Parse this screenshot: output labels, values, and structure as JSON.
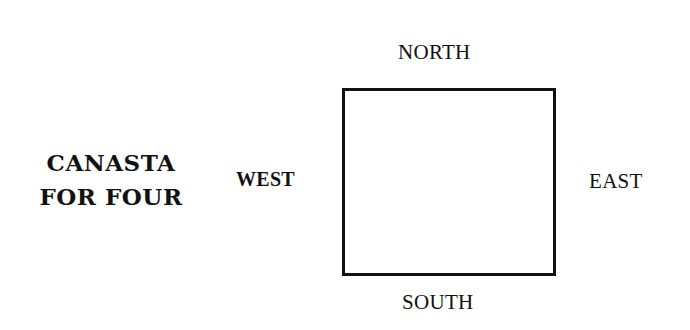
{
  "title": {
    "line1": "CANASTA",
    "line2": "FOR FOUR"
  },
  "diagram": {
    "center_shape": "card-table-square",
    "positions": {
      "north": "NORTH",
      "south": "SOUTH",
      "west": "WEST",
      "east": "EAST"
    }
  },
  "colors": {
    "ink": "#111111",
    "background": "#ffffff"
  }
}
